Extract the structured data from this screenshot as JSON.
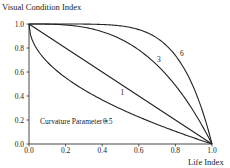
{
  "chart_data": {
    "type": "line",
    "title": "",
    "ylabel": "Visual Condition Index",
    "xlabel": "Life Index",
    "xlim": [
      0.0,
      1.0
    ],
    "ylim": [
      0.0,
      1.0
    ],
    "grid": false,
    "legend": "none (curves labeled inline)",
    "x_ticks": [
      "0.0",
      "0.2",
      "0.4",
      "0.6",
      "0.8",
      "1.0"
    ],
    "y_ticks": [
      "0.0",
      "0.2",
      "0.4",
      "0.6",
      "0.8",
      "1.0"
    ],
    "formula": "y = 1 - x^c",
    "annotation": "Curvature Parameter =",
    "x": [
      0.0,
      0.1,
      0.2,
      0.3,
      0.4,
      0.5,
      0.6,
      0.7,
      0.8,
      0.9,
      1.0
    ],
    "series": [
      {
        "name": "0.5",
        "curvature": 0.5,
        "values": [
          1.0,
          0.684,
          0.553,
          0.452,
          0.368,
          0.293,
          0.225,
          0.163,
          0.106,
          0.051,
          0.0
        ]
      },
      {
        "name": "1",
        "curvature": 1,
        "values": [
          1.0,
          0.9,
          0.8,
          0.7,
          0.6,
          0.5,
          0.4,
          0.3,
          0.2,
          0.1,
          0.0
        ]
      },
      {
        "name": "3",
        "curvature": 3,
        "values": [
          1.0,
          0.999,
          0.992,
          0.973,
          0.936,
          0.875,
          0.784,
          0.657,
          0.488,
          0.271,
          0.0
        ]
      },
      {
        "name": "6",
        "curvature": 6,
        "values": [
          1.0,
          1.0,
          1.0,
          0.999,
          0.996,
          0.984,
          0.953,
          0.882,
          0.738,
          0.469,
          0.0
        ]
      }
    ],
    "curve_labels": [
      {
        "text": "6",
        "x": 0.825,
        "y": 0.735
      },
      {
        "text": "3",
        "x": 0.7,
        "y": 0.68
      },
      {
        "text": "1",
        "x": 0.5,
        "y": 0.41
      },
      {
        "text": "0.5",
        "x": 0.405,
        "y": 0.165
      }
    ],
    "annotation_pos": {
      "x": 0.06,
      "y": 0.165
    }
  }
}
